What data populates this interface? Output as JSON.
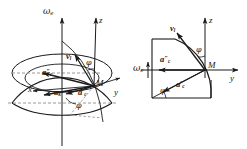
{
  "figure": {
    "type": "mechanics-vector-diagram",
    "background_color": "#ffffff",
    "stroke_color": "#1a1a1a",
    "dashed_color": "#8c8c8c"
  },
  "left_panel": {
    "name": "hemisphere-3d-view",
    "labels": {
      "omega_e": "ω",
      "omega_e_sub": "e",
      "axis_z": "z",
      "axis_x": "x",
      "axis_y": "y",
      "point_m": "M",
      "vector_v": "v",
      "vector_v_sub": "l",
      "vector_ak": "a",
      "vector_ak_sub": "k",
      "vector_ac_double": "a",
      "vector_ac_double_sub": "c",
      "vector_ac_double_prime": "″",
      "vector_ac_single": "a",
      "vector_ac_single_sub": "c",
      "vector_ac_single_prime": "′",
      "angle_phi_upper": "φ",
      "angle_phi_lower": "φ"
    }
  },
  "right_panel": {
    "name": "meridian-cross-section",
    "labels": {
      "omega_e": "ω",
      "omega_e_sub": "e",
      "axis_z": "z",
      "axis_y": "y",
      "point_m": "M",
      "vector_v": "v",
      "vector_v_sub": "l",
      "vector_ac_double": "a",
      "vector_ac_double_sub": "c",
      "vector_ac_double_prime": "″",
      "vector_ac_single": "a",
      "vector_ac_single_sub": "c",
      "vector_ac_single_prime": "′",
      "angle_phi_upper": "φ",
      "angle_phi_lower": "φ"
    }
  }
}
